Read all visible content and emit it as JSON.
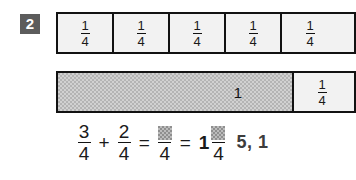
{
  "exercise": {
    "number": "2"
  },
  "unit_strip": {
    "cells": [
      {
        "numerator": "1",
        "denominator": "4"
      },
      {
        "numerator": "1",
        "denominator": "4"
      },
      {
        "numerator": "1",
        "denominator": "4"
      },
      {
        "numerator": "1",
        "denominator": "4"
      },
      {
        "numerator": "1",
        "denominator": "4"
      }
    ]
  },
  "sum_strip": {
    "whole_label": "1",
    "remainder": {
      "numerator": "1",
      "denominator": "4"
    }
  },
  "equation": {
    "first": {
      "numerator": "3",
      "denominator": "4"
    },
    "plus": "+",
    "second": {
      "numerator": "2",
      "denominator": "4"
    },
    "equals_1": "=",
    "improper": {
      "numerator": "",
      "denominator": "4"
    },
    "equals_2": "=",
    "mixed_whole": "1",
    "mixed_fraction": {
      "numerator": "",
      "denominator": "4"
    },
    "answer_annotation": "5, 1"
  },
  "colors": {
    "badge_background": "#5c5c5c",
    "badge_text": "#ffffff",
    "cell_fill": "#f2f2f2",
    "shaded_fill": "#b4b4b4",
    "border": "#121212",
    "answer_text": "#3d3d3d",
    "page_background": "#ffffff"
  }
}
